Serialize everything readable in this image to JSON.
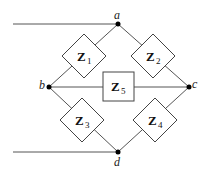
{
  "diagram": {
    "type": "bridge-circuit",
    "nodes": {
      "a": {
        "label": "a"
      },
      "b": {
        "label": "b"
      },
      "c": {
        "label": "c"
      },
      "d": {
        "label": "d"
      }
    },
    "impedances": [
      {
        "id": "Z1",
        "symbol": "Z",
        "subscript": "1",
        "between": [
          "a",
          "b"
        ]
      },
      {
        "id": "Z2",
        "symbol": "Z",
        "subscript": "2",
        "between": [
          "a",
          "c"
        ]
      },
      {
        "id": "Z3",
        "symbol": "Z",
        "subscript": "3",
        "between": [
          "b",
          "d"
        ]
      },
      {
        "id": "Z4",
        "symbol": "Z",
        "subscript": "4",
        "between": [
          "c",
          "d"
        ]
      },
      {
        "id": "Z5",
        "symbol": "Z",
        "subscript": "5",
        "between": [
          "b",
          "c"
        ]
      }
    ],
    "terminals": [
      "input-lead-top-to-a",
      "input-lead-bottom-to-d"
    ]
  }
}
